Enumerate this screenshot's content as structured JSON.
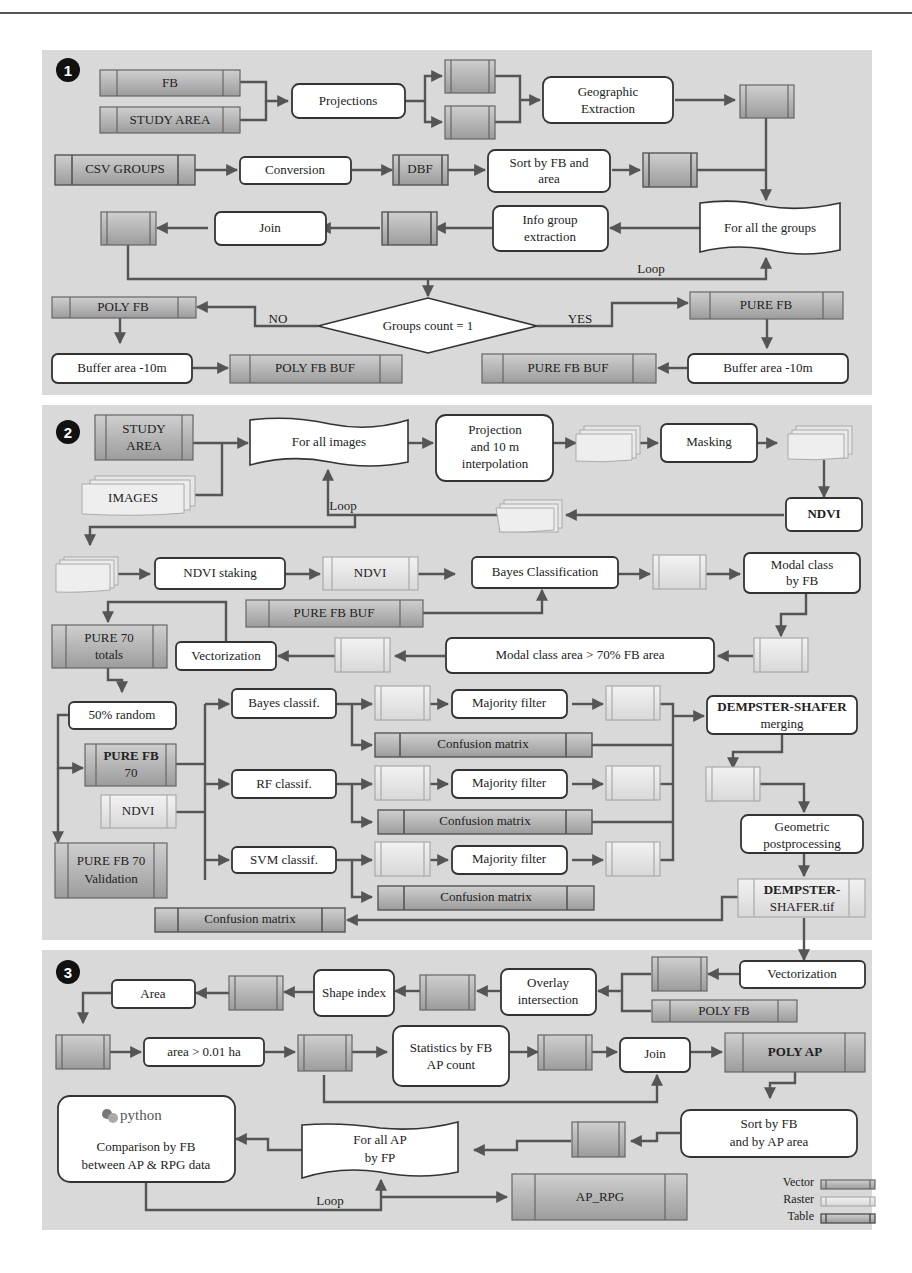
{
  "panels": [
    {
      "id": "1",
      "badge": "1"
    },
    {
      "id": "2",
      "badge": "2"
    },
    {
      "id": "3",
      "badge": "3"
    }
  ],
  "p1": {
    "fb": "FB",
    "study_area": "STUDY AREA",
    "projections": "Projections",
    "geo_extraction_1": "Geographic",
    "geo_extraction_2": "Extraction",
    "csv_groups": "CSV GROUPS",
    "conversion": "Conversion",
    "dbf": "DBF",
    "sort_1": "Sort by FB and",
    "sort_2": "area",
    "for_all_groups": "For all the groups",
    "info_1": "Info group",
    "info_2": "extraction",
    "join": "Join",
    "loop": "Loop",
    "decision": "Groups count = 1",
    "no": "NO",
    "yes": "YES",
    "poly_fb": "POLY FB",
    "pure_fb": "PURE FB",
    "buffer_left": "Buffer area -10m",
    "buffer_right": "Buffer area -10m",
    "poly_fb_buf": "POLY FB BUF",
    "pure_fb_buf": "PURE FB BUF"
  },
  "p2": {
    "study_area_1": "STUDY",
    "study_area_2": "AREA",
    "images": "IMAGES",
    "for_all_images": "For all images",
    "proj_1": "Projection",
    "proj_2": "and 10 m",
    "proj_3": "interpolation",
    "masking": "Masking",
    "ndvi_proc": "NDVI",
    "loop": "Loop",
    "ndvi_staking": "NDVI staking",
    "ndvi_raster": "NDVI",
    "bayes_classification": "Bayes Classification",
    "modal_1": "Modal class",
    "modal_2": "by FB",
    "pure_fb_buf": "PURE FB BUF",
    "pure70_1": "PURE 70",
    "pure70_2": "totals",
    "vectorization": "Vectorization",
    "modal_area": "Modal class area > 70% FB area",
    "random": "50% random",
    "bayes_classif": "Bayes classif.",
    "rf_classif": "RF classif.",
    "svm_classif": "SVM classif.",
    "majority_1": "Majority filter",
    "majority_2": "Majority filter",
    "majority_3": "Majority filter",
    "confusion_1": "Confusion matrix",
    "confusion_2": "Confusion matrix",
    "confusion_3": "Confusion matrix",
    "confusion_final": "Confusion matrix",
    "pure_fb70_1": "PURE FB",
    "pure_fb70_2": "70",
    "ndvi_small": "NDVI",
    "validation_1": "PURE FB 70",
    "validation_2": "Validation",
    "ds_merge_1": "DEMPSTER-SHAFER",
    "ds_merge_2": "merging",
    "geom_1": "Geometric",
    "geom_2": "postprocessing",
    "ds_tif_1": "DEMPSTER-",
    "ds_tif_2": "SHAFER.tif"
  },
  "p3": {
    "vectorization": "Vectorization",
    "overlay_1": "Overlay",
    "overlay_2": "intersection",
    "poly_fb": "POLY FB",
    "shape_index": "Shape index",
    "area": "Area",
    "area_filter": "area > 0.01 ha",
    "stats_1": "Statistics by FB",
    "stats_2": "AP count",
    "join": "Join",
    "poly_ap": "POLY AP",
    "python": "python",
    "compare_1": "Comparison by FB",
    "compare_2": "between AP & RPG data",
    "for_all_ap_1": "For all AP",
    "for_all_ap_2": "by FP",
    "sort_1": "Sort by FB",
    "sort_2": "and by AP area",
    "loop": "Loop",
    "ap_rpg": "AP_RPG"
  },
  "legend": {
    "vector": "Vector",
    "raster": "Raster",
    "table": "Table"
  },
  "colors": {
    "panel_bg": "#d9d9d9",
    "vector_fill": "#b0b0b0",
    "raster_fill": "#e6e6e6",
    "arrow": "#555555"
  }
}
